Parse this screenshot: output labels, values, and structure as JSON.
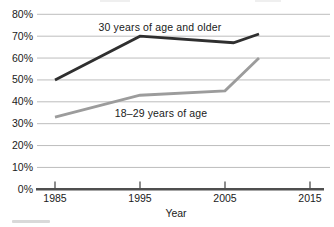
{
  "colors": {
    "series_older": "#2f2f2f",
    "series_younger": "#9c9c9c",
    "gridline": "#bdbdbd",
    "axis": "#4f4f4f",
    "text": "#1a1a1a",
    "background": "#ffffff"
  },
  "chart_data": {
    "type": "line",
    "title": "",
    "xlabel": "Year",
    "ylabel": "",
    "xlim": [
      1985,
      2015
    ],
    "ylim": [
      0,
      80
    ],
    "grid": true,
    "legend_position": "inline-annotations",
    "x_tick_values": [
      1985,
      1995,
      2005,
      2015
    ],
    "x_tick_labels": [
      "1985",
      "1995",
      "2005",
      "2015"
    ],
    "y_tick_values": [
      0,
      10,
      20,
      30,
      40,
      50,
      60,
      70,
      80
    ],
    "y_tick_labels": [
      "0%",
      "10%",
      "20%",
      "30%",
      "40%",
      "50%",
      "60%",
      "70%",
      "80%"
    ],
    "series": [
      {
        "name": "30 years of age and older",
        "x": [
          1985,
          1995,
          2006,
          2009
        ],
        "values": [
          50,
          70,
          67,
          71
        ],
        "color": "#2f2f2f"
      },
      {
        "name": "18–29 years of age",
        "x": [
          1985,
          1995,
          2005,
          2009
        ],
        "values": [
          33,
          43,
          45,
          60
        ],
        "color": "#9c9c9c"
      }
    ],
    "annotations": [
      {
        "text": "30 years of age and older",
        "cx": 160,
        "cy": 27
      },
      {
        "text": "18–29 years of age",
        "cx": 161,
        "cy": 113
      }
    ]
  }
}
